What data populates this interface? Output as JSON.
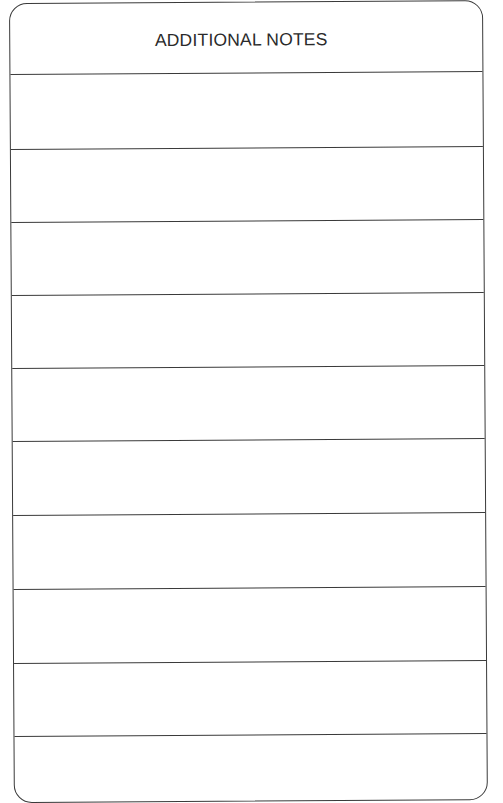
{
  "form": {
    "title": "ADDITIONAL NOTES",
    "line_color": "#3a3a3a",
    "rows": [
      {
        "index": 1,
        "text": ""
      },
      {
        "index": 2,
        "text": ""
      },
      {
        "index": 3,
        "text": ""
      },
      {
        "index": 4,
        "text": ""
      },
      {
        "index": 5,
        "text": ""
      },
      {
        "index": 6,
        "text": ""
      },
      {
        "index": 7,
        "text": ""
      },
      {
        "index": 8,
        "text": ""
      },
      {
        "index": 9,
        "text": ""
      },
      {
        "index": 10,
        "text": ""
      }
    ]
  }
}
